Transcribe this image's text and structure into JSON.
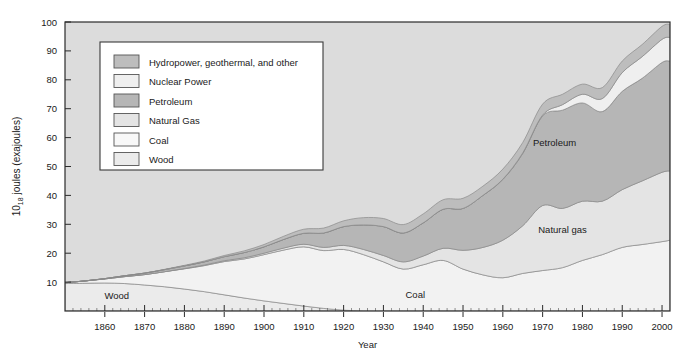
{
  "chart_data": {
    "type": "area",
    "stacked": true,
    "title": "",
    "xlabel": "Year",
    "ylabel": "10_18 joules (exajoules)",
    "ylabel_base": "10",
    "ylabel_exponent": "18",
    "ylabel_rest": "joules (exajoules)",
    "xlim": [
      1850,
      2002
    ],
    "ylim": [
      0,
      100
    ],
    "xticks": [
      1860,
      1870,
      1880,
      1890,
      1900,
      1910,
      1920,
      1930,
      1940,
      1950,
      1960,
      1970,
      1980,
      1990,
      2000
    ],
    "yticks": [
      10,
      20,
      30,
      40,
      50,
      60,
      70,
      80,
      90,
      100
    ],
    "grid": false,
    "legend_position": "upper-left-inside",
    "x": [
      1850,
      1855,
      1860,
      1865,
      1870,
      1875,
      1880,
      1885,
      1890,
      1895,
      1900,
      1905,
      1910,
      1915,
      1920,
      1925,
      1930,
      1935,
      1940,
      1945,
      1950,
      1955,
      1960,
      1965,
      1970,
      1975,
      1980,
      1985,
      1990,
      1995,
      2000,
      2002
    ],
    "series": [
      {
        "name": "Wood",
        "order": 1,
        "color": "#ebebeb",
        "values": [
          9.5,
          9.6,
          9.7,
          9.5,
          9.0,
          8.4,
          7.6,
          6.7,
          5.6,
          4.5,
          3.5,
          2.6,
          1.7,
          0.9,
          0.3,
          0.0,
          0.0,
          0.0,
          0.0,
          0.0,
          0.0,
          0.0,
          0.0,
          0.0,
          0.0,
          0.0,
          0.0,
          0.0,
          0.0,
          0.0,
          0.0,
          0.0
        ]
      },
      {
        "name": "Coal",
        "order": 2,
        "color": "#f2f2f2",
        "values": [
          0.3,
          0.8,
          1.4,
          2.4,
          3.6,
          5.2,
          7.0,
          9.0,
          11.5,
          13.5,
          16.0,
          18.5,
          20.5,
          20.0,
          21.0,
          19.5,
          17.0,
          14.5,
          16.0,
          17.5,
          14.5,
          12.5,
          11.5,
          13.0,
          14.0,
          15.0,
          17.5,
          19.5,
          22.0,
          23.0,
          24.0,
          24.5
        ]
      },
      {
        "name": "Natural Gas",
        "order": 3,
        "color": "#e4e4e4",
        "values": [
          0.0,
          0.0,
          0.0,
          0.0,
          0.0,
          0.0,
          0.1,
          0.2,
          0.3,
          0.4,
          0.5,
          0.7,
          0.9,
          1.1,
          1.4,
          1.8,
          2.2,
          2.5,
          3.0,
          4.2,
          6.5,
          9.5,
          13.0,
          16.5,
          22.5,
          20.5,
          20.5,
          18.5,
          20.0,
          22.0,
          24.0,
          24.0
        ]
      },
      {
        "name": "Petroleum",
        "order": 4,
        "color": "#b6b6b6",
        "values": [
          0.0,
          0.0,
          0.1,
          0.3,
          0.5,
          0.7,
          0.9,
          1.1,
          1.4,
          1.8,
          2.2,
          3.0,
          3.8,
          5.0,
          6.5,
          8.5,
          10.0,
          10.0,
          11.5,
          13.5,
          14.5,
          18.0,
          21.0,
          25.0,
          31.0,
          34.0,
          34.0,
          31.0,
          34.0,
          35.5,
          38.0,
          38.0
        ]
      },
      {
        "name": "Nuclear Power",
        "order": 5,
        "color": "#efefef",
        "values": [
          0.0,
          0.0,
          0.0,
          0.0,
          0.0,
          0.0,
          0.0,
          0.0,
          0.0,
          0.0,
          0.0,
          0.0,
          0.0,
          0.0,
          0.0,
          0.0,
          0.0,
          0.0,
          0.0,
          0.0,
          0.0,
          0.0,
          0.1,
          0.2,
          0.3,
          1.9,
          3.0,
          4.5,
          6.5,
          7.5,
          8.0,
          8.2
        ]
      },
      {
        "name": "Hydropower, geothermal, and other",
        "order": 6,
        "color": "#bdbdbd",
        "values": [
          0.0,
          0.0,
          0.0,
          0.0,
          0.0,
          0.1,
          0.2,
          0.3,
          0.4,
          0.6,
          0.8,
          1.1,
          1.4,
          1.7,
          2.0,
          2.5,
          2.8,
          2.9,
          3.1,
          3.3,
          3.5,
          3.2,
          3.5,
          3.6,
          3.8,
          3.6,
          3.5,
          3.8,
          4.0,
          4.2,
          4.5,
          4.5
        ]
      }
    ]
  },
  "legend": {
    "items": [
      {
        "label": "Hydropower, geothermal, and other",
        "color": "#bdbdbd"
      },
      {
        "label": "Nuclear Power",
        "color": "#efefef"
      },
      {
        "label": "Petroleum",
        "color": "#b6b6b6"
      },
      {
        "label": "Natural Gas",
        "color": "#e4e4e4"
      },
      {
        "label": "Coal",
        "color": "#f8f8f8"
      },
      {
        "label": "Wood",
        "color": "#ebebeb"
      }
    ]
  },
  "annotations": [
    {
      "text": "Wood",
      "x": 1863,
      "y": 4.0
    },
    {
      "text": "Coal",
      "x": 1938,
      "y": 4.5
    },
    {
      "text": "Natural gas",
      "x": 1975,
      "y": 27.0
    },
    {
      "text": "Petroleum",
      "x": 1973,
      "y": 57.0
    }
  ],
  "axes": {
    "x_title": "Year",
    "x_tick_labels": [
      "1860",
      "1870",
      "1880",
      "1890",
      "1900",
      "1910",
      "1920",
      "1930",
      "1940",
      "1950",
      "1960",
      "1970",
      "1980",
      "1990",
      "2000"
    ],
    "y_tick_labels": [
      "10",
      "20",
      "30",
      "40",
      "50",
      "60",
      "70",
      "80",
      "90",
      "100"
    ]
  },
  "colors": {
    "plot_background": "#dcdcdc",
    "page_background": "#ffffff",
    "axis_line": "#2b2b2b",
    "series_outline": "#8a8a8a",
    "legend_background": "#ffffff",
    "legend_border": "#3a3a3a",
    "text": "#1a1a1a"
  }
}
